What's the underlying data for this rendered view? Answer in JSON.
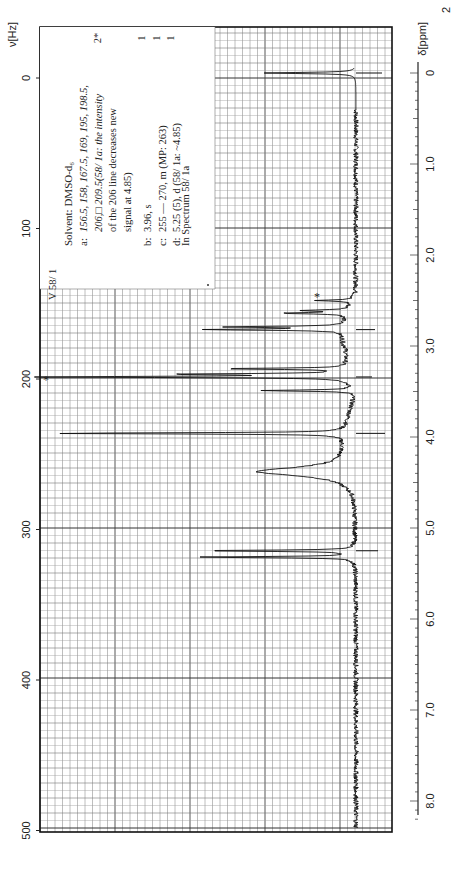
{
  "figure": {
    "spectrum_id": "V 58/ 1",
    "hz_axis_label": "ν[Hz]",
    "ppm_axis_label": "δ[ppm]",
    "corner_mark": "2"
  },
  "annotation": {
    "solvent": "Solvent: DMSO-d₆",
    "lines": [
      {
        "key": "a:",
        "text": "156.5, 158, 167.5, 169, 195, 198.5,",
        "italic": true
      },
      {
        "key": "",
        "text": "206,□ 209.5(58/ 1a: the intensity",
        "italic": true
      },
      {
        "key": "",
        "text": "of the 206 line decreases new",
        "italic": false
      },
      {
        "key": "",
        "text": "signal at 4.85)",
        "italic": false
      },
      {
        "key": "b:",
        "text": "3.96, s",
        "italic": false
      },
      {
        "key": "c:",
        "text": "255 — 270, m (MP: 263)",
        "italic": false
      },
      {
        "key": "d:",
        "text": "5.25 (5), d (58/ 1a: ~4.85)",
        "italic": false
      }
    ],
    "integrals": [
      "2*",
      "1",
      "1",
      "1"
    ],
    "reference": "In Spectrum 58/ 1a"
  },
  "chart_data": {
    "type": "line",
    "orientation": "rotated 90° (chemical shift runs top→bottom, intensity runs right→left)",
    "xlabel": "δ[ppm]",
    "x2label": "ν[Hz]",
    "ylabel": "Intensity",
    "ppm_ticks": [
      "0",
      "1.0",
      "2.0",
      "3.0",
      "4.0",
      "5.0",
      "6.0",
      "7.0",
      "8.0"
    ],
    "hz_ticks": [
      "0",
      "100",
      "200",
      "300",
      "400",
      "500"
    ],
    "xlim_ppm": [
      0,
      8.3
    ],
    "xlim_hz": [
      0,
      500
    ],
    "grid": true,
    "peaks": [
      {
        "ppm": 0.0,
        "intensity": 0.3,
        "label": "TMS"
      },
      {
        "ppm": 2.5,
        "intensity": 0.12,
        "label": "* DMSO"
      },
      {
        "ppm": 2.61,
        "intensity": 0.15,
        "label": "a"
      },
      {
        "ppm": 2.64,
        "intensity": 0.22,
        "label": "a"
      },
      {
        "ppm": 2.79,
        "intensity": 0.38,
        "label": "a"
      },
      {
        "ppm": 2.82,
        "intensity": 0.45,
        "label": "a"
      },
      {
        "ppm": 3.25,
        "intensity": 0.42,
        "label": "a"
      },
      {
        "ppm": 3.31,
        "intensity": 0.55,
        "label": "a"
      },
      {
        "ppm": 3.34,
        "intensity": 1.0,
        "label": "* H2O"
      },
      {
        "ppm": 3.49,
        "intensity": 0.3,
        "label": "a"
      },
      {
        "ppm": 3.96,
        "intensity": 0.97,
        "label": "b"
      },
      {
        "ppm": 4.38,
        "intensity": 0.3,
        "label": "c"
      },
      {
        "ppm": 5.25,
        "intensity": 0.52,
        "label": "d"
      },
      {
        "ppm": 5.32,
        "intensity": 0.51,
        "label": "d"
      }
    ]
  }
}
